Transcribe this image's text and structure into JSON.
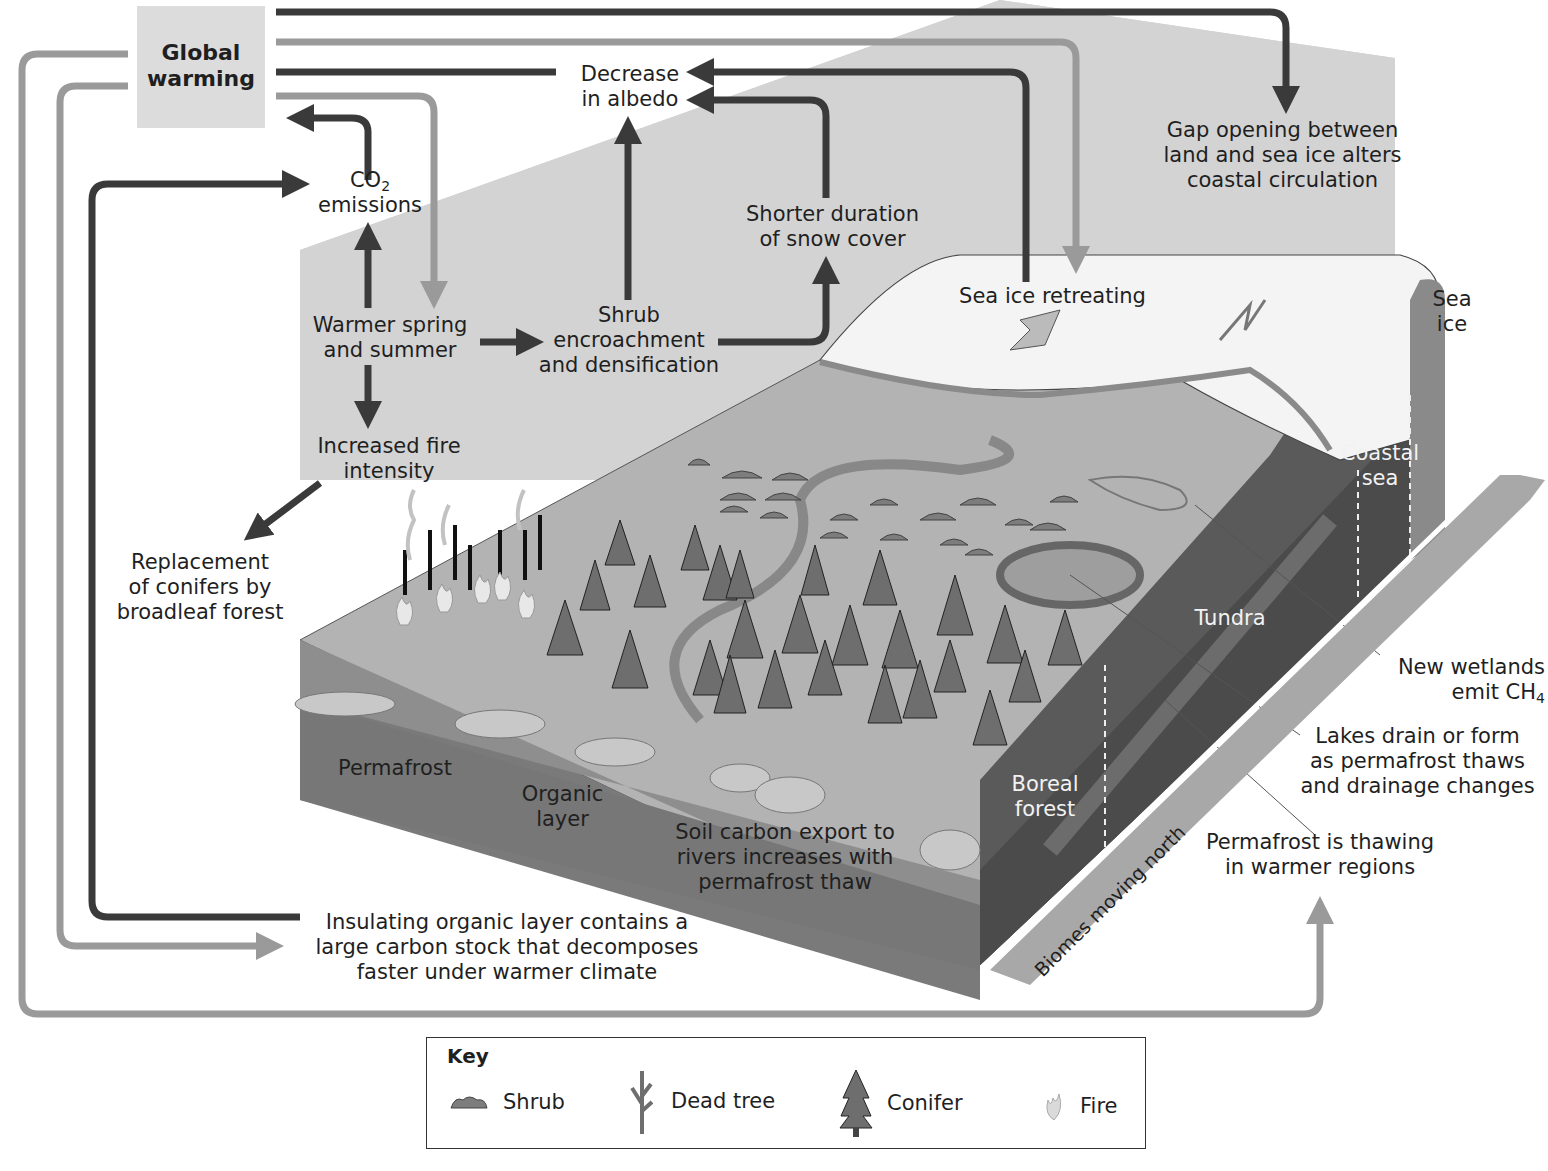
{
  "diagram": {
    "title_node": "Global warming",
    "nodes": {
      "decrease_albedo": [
        "Decrease",
        "in albedo"
      ],
      "co2": {
        "line1": "CO",
        "sub": "2",
        "line2": "emissions"
      },
      "warmer_spring": [
        "Warmer spring",
        "and summer"
      ],
      "shrub_encroachment": [
        "Shrub",
        "encroachment",
        "and densification"
      ],
      "shorter_snow": [
        "Shorter duration",
        "of snow cover"
      ],
      "sea_ice_retreating": "Sea ice retreating",
      "gap_opening": [
        "Gap opening between",
        "land and sea ice alters",
        "coastal circulation"
      ],
      "increased_fire": [
        "Increased fire",
        "intensity"
      ],
      "replacement_conifers": [
        "Replacement",
        "of conifers by",
        "broadleaf forest"
      ],
      "insulating_layer": [
        "Insulating organic layer contains a",
        "large carbon stock that decomposes",
        "faster under warmer climate"
      ],
      "permafrost_thawing": [
        "Permafrost is thawing",
        "in warmer regions"
      ],
      "new_wetlands": {
        "line1": "New wetlands",
        "line2": "emit CH",
        "sub": "4"
      },
      "lakes_drain": [
        "Lakes drain or form",
        "as permafrost thaws",
        "and drainage changes"
      ],
      "soil_carbon": [
        "Soil carbon export to",
        "rivers increases with",
        "permafrost thaw"
      ]
    },
    "landscape_labels": {
      "permafrost": "Permafrost",
      "organic_layer": [
        "Organic",
        "layer"
      ],
      "boreal_forest": [
        "Boreal",
        "forest"
      ],
      "tundra": "Tundra",
      "coastal_sea": [
        "Coastal",
        "sea"
      ],
      "sea_ice": [
        "Sea",
        "ice"
      ],
      "biomes_moving_north": "Biomes moving north"
    },
    "colors": {
      "dark_arrow": "#3a3a3a",
      "light_arrow": "#9a9a9a",
      "gw_box": "#dcdcdc",
      "block_top": "#b4b4b4",
      "block_side": "#8a8a8a",
      "block_front": "#5a5a5a",
      "ice": "#f4f4f4",
      "sky_panel": "#d6d6d6"
    }
  },
  "key": {
    "title": "Key",
    "items": [
      {
        "icon": "shrub-icon",
        "label": "Shrub"
      },
      {
        "icon": "dead-tree-icon",
        "label": "Dead tree"
      },
      {
        "icon": "conifer-icon",
        "label": "Conifer"
      },
      {
        "icon": "fire-icon",
        "label": "Fire"
      }
    ]
  }
}
